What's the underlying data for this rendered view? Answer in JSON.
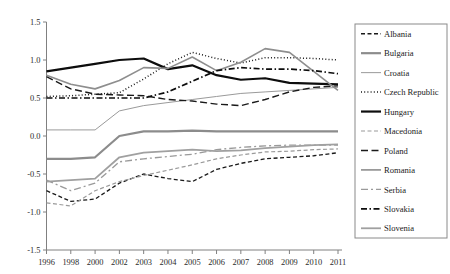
{
  "chart_data": {
    "type": "line",
    "title": "",
    "xlabel": "",
    "ylabel": "",
    "x": [
      "1996",
      "1998",
      "2000",
      "2002",
      "2003",
      "2004",
      "2005",
      "2006",
      "2007",
      "2008",
      "2009",
      "2010",
      "2011"
    ],
    "xlim": [
      0,
      12
    ],
    "ylim": [
      -1.5,
      1.5
    ],
    "yticks": [
      "1.5",
      "1.0",
      "0.5",
      "0.0",
      "-0.5",
      "-1.0",
      "-1.5"
    ],
    "ytick_values": [
      1.5,
      1.0,
      0.5,
      0.0,
      -0.5,
      -1.0,
      -1.5
    ],
    "grid": false,
    "legend_position": "right",
    "series": [
      {
        "name": "Albania",
        "style": "dashed-short",
        "color": "#1a1a1a",
        "width": 1.3,
        "dash": "4,2.5",
        "values": [
          -0.72,
          -0.86,
          -0.83,
          -0.62,
          -0.5,
          -0.56,
          -0.6,
          -0.44,
          -0.36,
          -0.3,
          -0.28,
          -0.26,
          -0.22
        ]
      },
      {
        "name": "Bulgaria",
        "style": "solid-gray-thick",
        "color": "#8c8c8c",
        "width": 2.2,
        "dash": "none",
        "values": [
          -0.3,
          -0.3,
          -0.28,
          0.0,
          0.06,
          0.06,
          0.07,
          0.06,
          0.06,
          0.06,
          0.06,
          0.06,
          0.06
        ]
      },
      {
        "name": "Croatia",
        "style": "solid-gray-thin",
        "color": "#9a9a9a",
        "width": 1.0,
        "dash": "none",
        "values": [
          0.08,
          0.08,
          0.08,
          0.33,
          0.4,
          0.44,
          0.48,
          0.52,
          0.56,
          0.58,
          0.6,
          0.62,
          0.64
        ]
      },
      {
        "name": "Czech Republic",
        "style": "dotted",
        "color": "#1a1a1a",
        "width": 1.5,
        "dash": "1,2.2",
        "values": [
          0.52,
          0.53,
          0.55,
          0.57,
          0.75,
          0.95,
          1.1,
          1.02,
          0.96,
          1.03,
          1.03,
          1.02,
          1.0
        ]
      },
      {
        "name": "Hungary",
        "style": "solid-black-thick",
        "color": "#0d0d0d",
        "width": 2.2,
        "dash": "none",
        "values": [
          0.85,
          0.9,
          0.95,
          1.0,
          1.02,
          0.88,
          0.93,
          0.8,
          0.74,
          0.76,
          0.7,
          0.69,
          0.68
        ]
      },
      {
        "name": "Macedonia",
        "style": "dashed-gray-short",
        "color": "#9a9a9a",
        "width": 1.2,
        "dash": "4,2.5",
        "values": [
          -0.88,
          -0.92,
          -0.72,
          -0.6,
          -0.52,
          -0.45,
          -0.38,
          -0.3,
          -0.25,
          -0.21,
          -0.2,
          -0.18,
          -0.17
        ]
      },
      {
        "name": "Poland",
        "style": "dashed-long",
        "color": "#1a1a1a",
        "width": 1.4,
        "dash": "7,3.5",
        "values": [
          0.78,
          0.62,
          0.55,
          0.54,
          0.53,
          0.48,
          0.46,
          0.42,
          0.4,
          0.48,
          0.58,
          0.64,
          0.66
        ]
      },
      {
        "name": "Romania",
        "style": "solid-gray-medium",
        "color": "#8e8e8e",
        "width": 1.6,
        "dash": "none",
        "values": [
          0.8,
          0.68,
          0.62,
          0.73,
          0.9,
          0.89,
          1.04,
          0.86,
          0.97,
          1.15,
          1.1,
          0.85,
          0.6
        ]
      },
      {
        "name": "Serbia",
        "style": "dash-dot-gray",
        "color": "#9a9a9a",
        "width": 1.3,
        "dash": "7,3,2,3",
        "values": [
          -0.58,
          -0.72,
          -0.62,
          -0.34,
          -0.3,
          -0.27,
          -0.24,
          -0.18,
          -0.15,
          -0.13,
          -0.12,
          -0.12,
          -0.12
        ]
      },
      {
        "name": "Slovakia",
        "style": "dash-dot-black",
        "color": "#0d0d0d",
        "width": 1.7,
        "dash": "6,2.5,1.5,2.5",
        "values": [
          0.5,
          0.5,
          0.5,
          0.5,
          0.5,
          0.58,
          0.72,
          0.86,
          0.9,
          0.88,
          0.88,
          0.86,
          0.82
        ]
      },
      {
        "name": "Slovenia",
        "style": "solid-gray-light",
        "color": "#a0a0a0",
        "width": 1.8,
        "dash": "none",
        "values": [
          -0.6,
          -0.58,
          -0.56,
          -0.28,
          -0.22,
          -0.2,
          -0.18,
          -0.2,
          -0.19,
          -0.16,
          -0.14,
          -0.12,
          -0.11
        ]
      }
    ]
  },
  "axes": {
    "axis_color": "#808080",
    "tick_color": "#808080"
  },
  "legend": {
    "border_color": "#8a8a8a",
    "items": [
      {
        "label": "Albania"
      },
      {
        "label": "Bulgaria"
      },
      {
        "label": "Croatia"
      },
      {
        "label": "Czech Republic"
      },
      {
        "label": "Hungary"
      },
      {
        "label": "Macedonia"
      },
      {
        "label": "Poland"
      },
      {
        "label": "Romania"
      },
      {
        "label": "Serbia"
      },
      {
        "label": "Slovakia"
      },
      {
        "label": "Slovenia"
      }
    ]
  }
}
